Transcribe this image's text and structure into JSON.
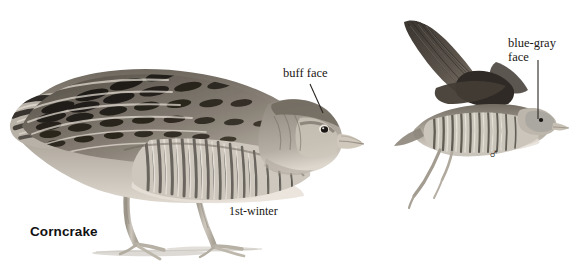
{
  "plate": {
    "background_color": "#ffffff",
    "width": 580,
    "height": 279,
    "subject": "Corncrake",
    "medium": "grayscale field-guide illustration"
  },
  "labels": {
    "species_name": "Corncrake",
    "age_label": "1st-winter",
    "buff_face": "buff face",
    "blue_gray_face_line1": "blue-gray",
    "blue_gray_face_line2": "face",
    "sex_symbol_male": "♂"
  },
  "figures": [
    {
      "id": "standing-bird",
      "name": "corncrake-1st-winter-standing",
      "pose": "standing, side profile, facing right",
      "age": "1st-winter",
      "annotation": "buff face",
      "bounds": {
        "x": 8,
        "y": 70,
        "width": 355,
        "height": 200
      }
    },
    {
      "id": "flying-bird",
      "name": "corncrake-male-in-flight",
      "pose": "in flight, wings raised, legs dangling, facing right",
      "sex": "male",
      "annotation": "blue-gray face",
      "bounds": {
        "x": 398,
        "y": 18,
        "width": 145,
        "height": 160
      }
    }
  ],
  "leader_lines": [
    {
      "name": "buff-face-leader",
      "from": [
        310,
        84
      ],
      "to": [
        323,
        113
      ]
    },
    {
      "name": "blue-gray-face-leader",
      "from": [
        538,
        60
      ],
      "to": [
        538,
        120
      ]
    }
  ],
  "palette": {
    "ink_dark": "#221f1c",
    "feather_dark": "#2e2a26",
    "feather_mid": "#7d776f",
    "feather_pale": "#cfc9bf",
    "bill_pale": "#c9c2b6",
    "leg_pale": "#b9b3a8",
    "ground_shadow": "#c8c4bd",
    "text": "#1a1714",
    "background": "#ffffff"
  }
}
